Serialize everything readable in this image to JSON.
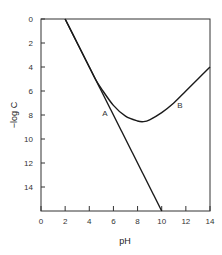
{
  "chart_data": {
    "type": "line",
    "title": "",
    "xlabel": "pH",
    "ylabel": "−log C",
    "xlim": [
      0,
      14
    ],
    "ylim": [
      0,
      16
    ],
    "y_inverted": true,
    "grid": false,
    "legend": null,
    "xticks": [
      0,
      2,
      4,
      6,
      8,
      10,
      12,
      14
    ],
    "yticks": [
      0,
      2,
      4,
      6,
      8,
      10,
      12,
      14
    ],
    "series": [
      {
        "name": "A",
        "x": [
          2,
          10
        ],
        "y": [
          0,
          16
        ],
        "label_pos": {
          "pH": 5.3,
          "negLogC": 8.1
        }
      },
      {
        "name": "B",
        "x": [
          2,
          3,
          4,
          4.5,
          5,
          6,
          7,
          8,
          8.5,
          9,
          10,
          11,
          12,
          13,
          14
        ],
        "y": [
          0,
          2,
          4,
          5.0,
          5.8,
          7.2,
          8.1,
          8.5,
          8.55,
          8.4,
          7.8,
          7.0,
          6.0,
          5.0,
          4.0
        ],
        "label_pos": {
          "pH": 11.5,
          "negLogC": 7.4
        }
      }
    ]
  }
}
